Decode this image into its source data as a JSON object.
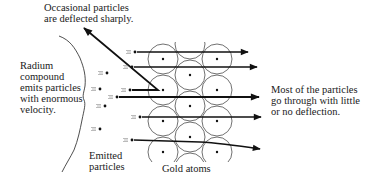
{
  "diagram": {
    "labels": {
      "deflected": "Occasional particles\nare deflected sharply.",
      "radium": "Radium\ncompound\nemits particles\nwith enormous\nvelocity.",
      "emitted": "Emitted\nparticles",
      "gold": "Gold atoms",
      "most": "Most of the particles\ngo through with little\nor no deflection."
    },
    "elements": {
      "gold_atoms": {
        "columns": 3,
        "pattern": "hexagonal close-packed"
      },
      "particle_paths": [
        {
          "name": "straight-path-1",
          "outcome": "passes through"
        },
        {
          "name": "straight-path-2",
          "outcome": "passes through"
        },
        {
          "name": "deflected-path",
          "outcome": "deflected sharply back"
        },
        {
          "name": "straight-path-3",
          "outcome": "passes through"
        },
        {
          "name": "straight-path-4",
          "outcome": "passes through"
        },
        {
          "name": "slightly-deflected-path",
          "outcome": "slight deflection"
        }
      ]
    }
  }
}
